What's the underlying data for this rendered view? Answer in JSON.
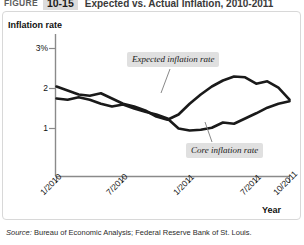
{
  "header": {
    "figure_word": "FIGURE",
    "figure_number": "10-15",
    "title": "Expected vs. Actual Inflation, 2010-2011"
  },
  "source": {
    "label": "Source:",
    "text": "Bureau of Economic Analysis; Federal Reserve Bank of St. Louis."
  },
  "colors": {
    "series_line": "#1a1a1a",
    "axis": "#808080",
    "callout_bg": "#e0e0e0",
    "badge_bg": "#dcdcdc",
    "panel_border": "#d8d8d8"
  },
  "chart_data": {
    "type": "line",
    "title": "Expected vs. Actual Inflation, 2010-2011",
    "xlabel": "Year",
    "ylabel": "Inflation rate",
    "ylim": [
      0,
      3.2
    ],
    "yticks": [
      1,
      2,
      3
    ],
    "ytick_labels": [
      "1",
      "2",
      "3%"
    ],
    "xlim": [
      "1/2010",
      "10/2011"
    ],
    "xticks": [
      "1/2010",
      "7/2010",
      "1/2011",
      "7/2011",
      "10/2011"
    ],
    "grid": false,
    "legend": "annotations",
    "annotations": [
      {
        "text": "Expected inflation rate",
        "series": "Expected inflation rate"
      },
      {
        "text": "Core inflation rate",
        "series": "Core inflation rate"
      }
    ],
    "x": [
      "1/2010",
      "2/2010",
      "3/2010",
      "4/2010",
      "5/2010",
      "6/2010",
      "7/2010",
      "8/2010",
      "9/2010",
      "10/2010",
      "11/2010",
      "12/2010",
      "1/2011",
      "2/2011",
      "3/2011",
      "4/2011",
      "5/2011",
      "6/2011",
      "7/2011",
      "8/2011",
      "9/2011",
      "10/2011"
    ],
    "series": [
      {
        "name": "Expected inflation rate",
        "values": [
          2.05,
          1.95,
          1.85,
          1.82,
          1.88,
          1.75,
          1.62,
          1.55,
          1.45,
          1.3,
          1.22,
          1.35,
          1.62,
          1.85,
          2.05,
          2.2,
          2.3,
          2.28,
          2.12,
          2.18,
          2.02,
          1.72
        ]
      },
      {
        "name": "Core inflation rate",
        "values": [
          1.75,
          1.72,
          1.78,
          1.72,
          1.62,
          1.55,
          1.6,
          1.5,
          1.42,
          1.35,
          1.25,
          1.0,
          0.95,
          0.97,
          1.02,
          1.15,
          1.12,
          1.25,
          1.38,
          1.52,
          1.62,
          1.68
        ]
      }
    ]
  }
}
